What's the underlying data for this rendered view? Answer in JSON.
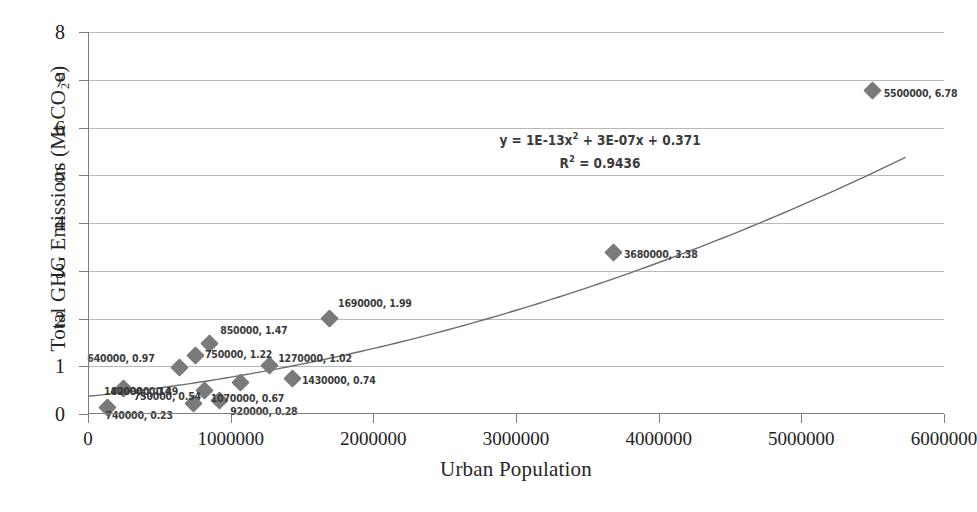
{
  "chart_data": {
    "type": "scatter",
    "title": "",
    "xlabel": "Urban Population",
    "ylabel": "Total GHG Emissions (Mt CO2e)",
    "ylabel_rich": "Total GHG Emissions (Mt CO₂e)",
    "xlim": [
      0,
      6000000
    ],
    "ylim": [
      0,
      8
    ],
    "xticks": [
      0,
      1000000,
      2000000,
      3000000,
      4000000,
      5000000,
      6000000
    ],
    "xtick_labels": [
      "0",
      "1000000",
      "2000000",
      "3000000",
      "4000000",
      "5000000",
      "6000000"
    ],
    "yticks": [
      0,
      1,
      2,
      3,
      4,
      5,
      6,
      7,
      8
    ],
    "ytick_labels": [
      "0",
      "1",
      "2",
      "3",
      "4",
      "5",
      "6",
      "7",
      "8"
    ],
    "grid": "horizontal",
    "legend": "none",
    "marker": "diamond",
    "marker_color": "#7a7a7a",
    "trendline_color": "#6e6e6e",
    "trendline_type": "polynomial-order-2",
    "x": [
      140000,
      250000,
      640000,
      740000,
      750000,
      820000,
      850000,
      920000,
      1070000,
      1270000,
      1430000,
      1690000,
      3680000,
      5500000
    ],
    "y": [
      0.14,
      0.54,
      0.97,
      0.23,
      1.22,
      0.49,
      1.47,
      0.28,
      0.67,
      1.02,
      0.74,
      1.99,
      3.38,
      6.78
    ],
    "points": [
      {
        "x": 140000,
        "y": 0.14,
        "label": "140000, 0.14",
        "lx": -4,
        "ly": -16
      },
      {
        "x": 250000,
        "y": 0.54,
        "label": "750000, 0.54",
        "lx": 10,
        "ly": 8
      },
      {
        "x": 640000,
        "y": 0.97,
        "label": "640000, 0.97",
        "lx": -92,
        "ly": -10
      },
      {
        "x": 740000,
        "y": 0.23,
        "label": "740000, 0.23",
        "lx": -88,
        "ly": 12
      },
      {
        "x": 750000,
        "y": 1.22,
        "label": "750000, 1.22",
        "lx": 10,
        "ly": -2
      },
      {
        "x": 820000,
        "y": 0.49,
        "label": "820000, 0.49",
        "lx": -94,
        "ly": 0
      },
      {
        "x": 850000,
        "y": 1.47,
        "label": "850000, 1.47",
        "lx": 11,
        "ly": -14
      },
      {
        "x": 920000,
        "y": 0.28,
        "label": "920000, 0.28",
        "lx": 11,
        "ly": 10
      },
      {
        "x": 1070000,
        "y": 0.67,
        "label": "1070000, 0.67",
        "lx": -30,
        "ly": 16
      },
      {
        "x": 1270000,
        "y": 1.02,
        "label": "1270000, 1.02",
        "lx": 9,
        "ly": -7
      },
      {
        "x": 1430000,
        "y": 0.74,
        "label": "1430000, 0.74",
        "lx": 10,
        "ly": 1
      },
      {
        "x": 1690000,
        "y": 1.99,
        "label": "1690000, 1.99",
        "lx": 9,
        "ly": -16
      },
      {
        "x": 3680000,
        "y": 3.38,
        "label": "3680000, 3.38",
        "lx": 11,
        "ly": 1
      },
      {
        "x": 5500000,
        "y": 6.78,
        "label": "5500000, 6.78",
        "lx": 11,
        "ly": 3
      }
    ],
    "annotations": {
      "equation_prefix": "y = 1E-13x",
      "equation_exp": "2",
      "equation_suffix": " + 3E-07x + 0.371",
      "r_squared_prefix": "R",
      "r_squared_exp": "2",
      "r_squared_suffix": " = 0.9436"
    }
  }
}
